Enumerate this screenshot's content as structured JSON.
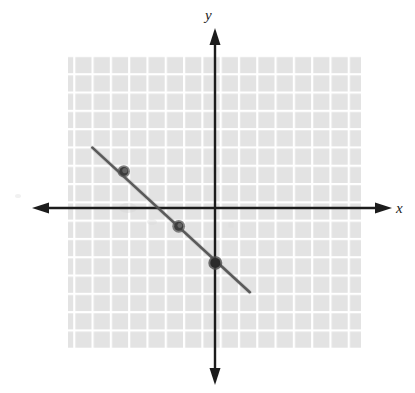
{
  "figure": {
    "title": "",
    "background_color": "#ffffff"
  },
  "axes": {
    "x_label": "x",
    "y_label": "y",
    "axis_color": "#1c1c1c",
    "origin_px": {
      "x": 215,
      "y": 208
    },
    "cell_px": 18.3,
    "x_axis_span_px": {
      "start": 32,
      "end": 392
    },
    "y_axis_span_px": {
      "start": 28,
      "end": 385
    },
    "arrowheads": [
      "left",
      "right",
      "up",
      "down"
    ],
    "tick_labels_x": [],
    "tick_labels_y": []
  },
  "grid": {
    "visible": true,
    "cell_fill_color": "#e3e3e3",
    "gridline_color": "#ffffff",
    "columns": 16,
    "rows": 16,
    "left_px": 68,
    "top_px": 55,
    "right_px": 361,
    "bottom_px": 348,
    "x_range": [
      -8,
      8
    ],
    "y_range": [
      -8,
      8
    ]
  },
  "chart_data": {
    "type": "line",
    "title": "",
    "xlabel": "x",
    "ylabel": "y",
    "xlim": [
      -8,
      8
    ],
    "ylim": [
      -8,
      8
    ],
    "grid": true,
    "legend": "none",
    "series": [
      {
        "name": "line",
        "style": "solid",
        "color": "#4a4a4a",
        "linewidth_px": 2.5,
        "slope": -1,
        "intercept": -3,
        "equation": "y = -x - 3",
        "endpoints": [
          {
            "x": -6.7,
            "y": 3.3
          },
          {
            "x": 1.9,
            "y": -4.6
          }
        ]
      }
    ],
    "points": [
      {
        "label": "",
        "x": -5,
        "y": 2,
        "marker": "filled-circle",
        "color": "#3f3f3f"
      },
      {
        "label": "",
        "x": -2,
        "y": -1,
        "marker": "filled-circle",
        "color": "#3f3f3f"
      },
      {
        "label": "",
        "x": 0,
        "y": -3,
        "marker": "filled-circle",
        "color": "#2e2e2e"
      }
    ],
    "annotations": []
  }
}
